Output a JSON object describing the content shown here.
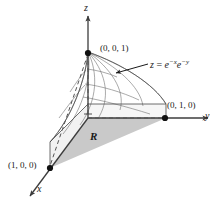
{
  "figure": {
    "axes": [
      {
        "name": "z-axis",
        "label": "z",
        "direction": "up"
      },
      {
        "name": "y-axis",
        "label": "y",
        "direction": "right"
      },
      {
        "name": "x-axis",
        "label": "x",
        "direction": "down-left"
      }
    ],
    "points": [
      {
        "name": "apex",
        "label": "(0, 0, 1)"
      },
      {
        "name": "y-intercept",
        "label": "(0, 1, 0)"
      },
      {
        "name": "x-intercept",
        "label": "(1, 0, 0)"
      }
    ],
    "region": {
      "label": "R",
      "fill": "#c9c9c9"
    },
    "equation": {
      "lhs": "z",
      "eq": "=",
      "base1": "e",
      "exp1": "−x",
      "base2": "e",
      "exp2": "−y",
      "full": "z = e^(-x)e^(-y)"
    },
    "colors": {
      "stroke": "#3c3c3c",
      "mesh": "#6e6e6e",
      "region_fill": "#c9c9c9",
      "wall_fill": "#efefef",
      "background": "#ffffff"
    }
  }
}
